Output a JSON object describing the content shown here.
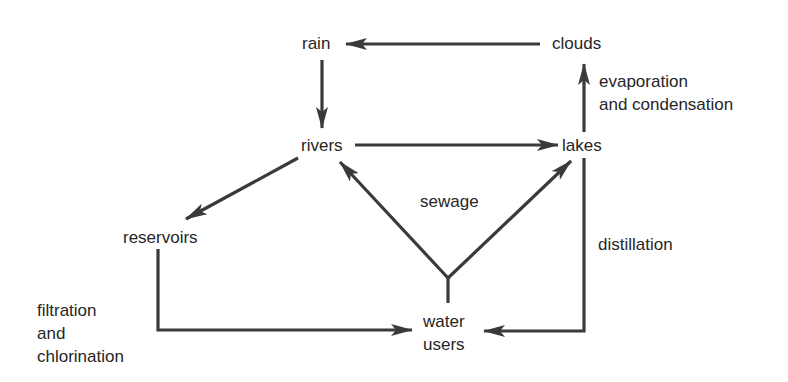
{
  "diagram": {
    "type": "flow-cycle",
    "nodes": {
      "rain": "rain",
      "clouds": "clouds",
      "rivers": "rivers",
      "lakes": "lakes",
      "reservoirs": "reservoirs",
      "water_users": "water\nusers"
    },
    "edge_labels": {
      "evaporation": "evaporation\nand condensation",
      "sewage": "sewage",
      "distillation": "distillation",
      "filtration": "filtration\nand\nchlorination"
    },
    "edges": [
      {
        "from": "clouds",
        "to": "rain"
      },
      {
        "from": "rain",
        "to": "rivers"
      },
      {
        "from": "rivers",
        "to": "lakes"
      },
      {
        "from": "lakes",
        "to": "clouds",
        "label": "evaporation and condensation"
      },
      {
        "from": "rivers",
        "to": "reservoirs"
      },
      {
        "from": "reservoirs",
        "to": "water users",
        "label": "filtration and chlorination"
      },
      {
        "from": "lakes",
        "to": "water users",
        "label": "distillation"
      },
      {
        "from": "water users",
        "to": "rivers",
        "label": "sewage"
      },
      {
        "from": "water users",
        "to": "lakes",
        "label": "sewage"
      }
    ],
    "colors": {
      "line": "#3a3a3a",
      "text": "#262626",
      "background": "#ffffff"
    }
  }
}
